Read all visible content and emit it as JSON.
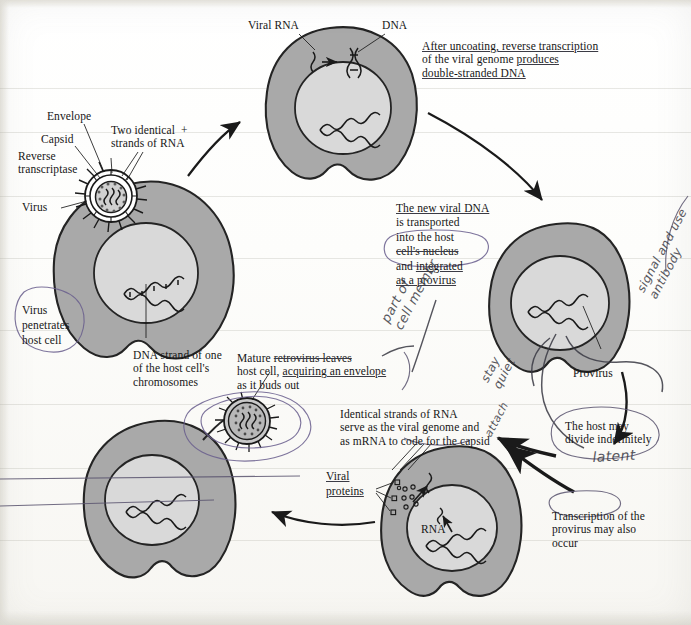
{
  "document": {
    "title": "Retrovirus (HIV) replication cycle — annotated textbook figure",
    "type": "scanned-biology-diagram"
  },
  "labels": {
    "envelope": "Envelope",
    "capsid": "Capsid",
    "reverse_transcriptase": "Reverse\ntranscriptase",
    "virus": "Virus",
    "two_strands_l1": "Two identical  +",
    "two_strands_l2": "strands of RNA",
    "viral_rna": "Viral RNA",
    "dna": "DNA",
    "provirus": "Provirus",
    "rna": "RNA",
    "viral_proteins_l1": "Viral",
    "viral_proteins_l2": "proteins"
  },
  "callouts": {
    "virus_penetrates": {
      "line1": "Virus",
      "line2": "penetrates",
      "line3": "host cell",
      "circled": true,
      "ink": "#6a5f8e"
    },
    "dna_strand_host": {
      "line1": "DNA strand of one",
      "line2": "of the host cell's",
      "line3": "chromosomes"
    },
    "after_uncoating": {
      "line1": "After uncoating, reverse transcription",
      "line2": "of the viral genome produces",
      "line3": "double-stranded DNA",
      "underlined_terms": [
        "uncoating",
        "reverse transcription",
        "produces",
        "double-stranded DNA"
      ]
    },
    "new_viral_dna": {
      "line1": "The new viral DNA",
      "line2": "is transported",
      "line3": "into the host",
      "line4": "cell's nucleus",
      "line5": "and integrated",
      "line6": "as a provirus",
      "circled_lines": [
        "and integrated",
        "as a provirus"
      ],
      "ink": "#6a5f8e"
    },
    "mature_retrovirus": {
      "line1": "Mature retrovirus leaves",
      "line2": "host cell, acquiring an envelope",
      "line3": "as it buds out",
      "underlined_terms": [
        "retrovirus leaves",
        "acquiring an envelope"
      ]
    },
    "identical_strands": {
      "line1": "Identical strands of RNA",
      "line2": "serve as the viral genome and",
      "line3": "as mRNA to code for the capsid"
    },
    "host_may_divide": {
      "line1": "The host may",
      "line2": "divide indefinitely",
      "circled": true,
      "ink": "#5b5570"
    },
    "transcription_provirus": {
      "line1": "Transcription of the",
      "line2": "provirus may also",
      "line3": "occur"
    }
  },
  "handwriting": [
    {
      "id": "part-of-cell-membrane",
      "text": "part of\ncell membr",
      "rotation": -62
    },
    {
      "id": "stay-quiet",
      "text": "stay\nquiet",
      "rotation": -62
    },
    {
      "id": "signal-and-use-antibody",
      "text": "signal and use\nantibody",
      "rotation": -62
    },
    {
      "id": "latent",
      "text": "latent",
      "rotation": -4
    },
    {
      "id": "attach-arrow-note",
      "text": "attach",
      "rotation": -62
    }
  ],
  "diagram_stages": [
    {
      "order": 1,
      "name": "virus-attaches-and-penetrates-host-cell",
      "position": "left"
    },
    {
      "order": 2,
      "name": "reverse-transcription-of-viral-genome",
      "position": "top"
    },
    {
      "order": 3,
      "name": "viral-dna-integrates-as-provirus",
      "position": "right"
    },
    {
      "order": 4,
      "name": "transcription-of-provirus-to-rna-and-proteins",
      "position": "bottom-right"
    },
    {
      "order": 5,
      "name": "assembly-and-budding-of-mature-retrovirus",
      "position": "bottom-left"
    }
  ],
  "colors": {
    "cytoplasm": "#a9a9a9",
    "nucleus": "#d9d9d9",
    "outline": "#242424",
    "ink_black": "#1a1a1a",
    "ink_pen": "#6a5f8e",
    "paper": "#fbfbf9"
  }
}
